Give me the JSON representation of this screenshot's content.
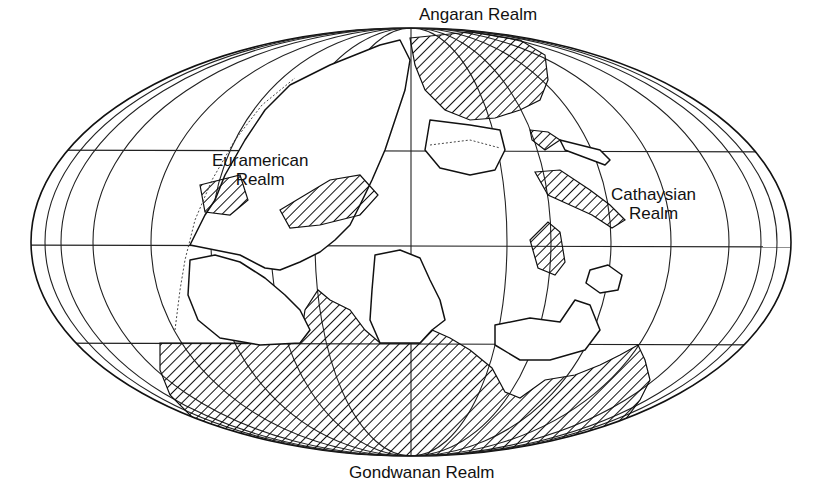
{
  "map": {
    "projection": "mollweide-like ellipse",
    "style": {
      "ink": "#111111",
      "background": "#ffffff",
      "hatch": "diagonal lines"
    },
    "realms": [
      {
        "id": "angaran",
        "lines": [
          "Angaran Realm"
        ]
      },
      {
        "id": "euramerican",
        "lines": [
          "Euramerican",
          "Realm"
        ]
      },
      {
        "id": "cathaysian",
        "lines": [
          "Cathaysian",
          "Realm"
        ]
      },
      {
        "id": "gondwanan",
        "lines": [
          "Gondwanan Realm"
        ]
      }
    ]
  }
}
